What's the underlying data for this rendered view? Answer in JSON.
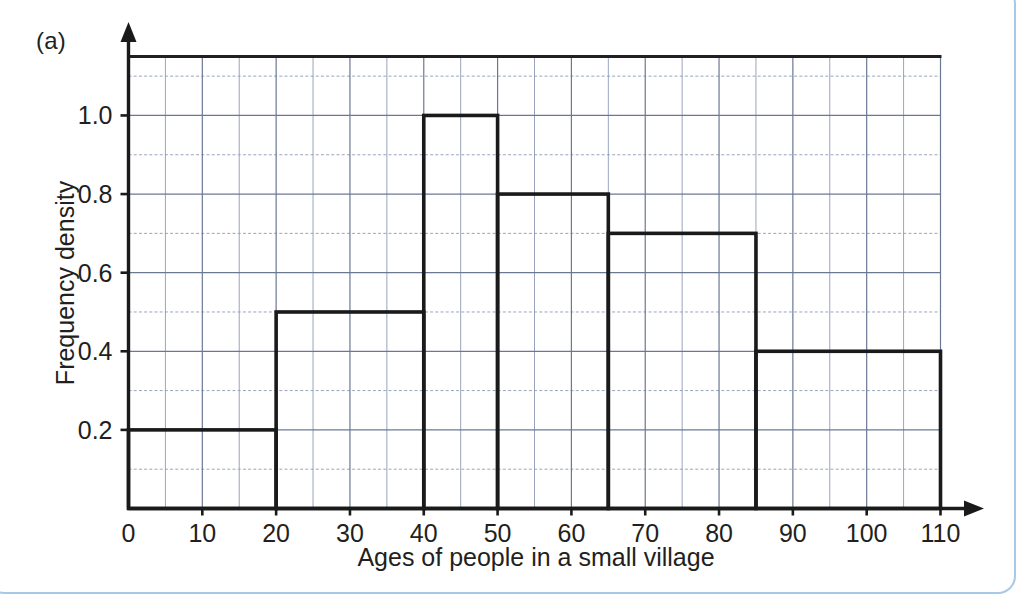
{
  "panel": {
    "label": "(a)"
  },
  "colors": {
    "ink": "#231f20",
    "grid_minor": "#8d9bb5",
    "grid_major": "#6b7894",
    "axis": "#1a1a1a",
    "bar_outline": "#1a1a1a",
    "frame": "#a9c8e6",
    "background": "#ffffff"
  },
  "chart_data": {
    "type": "bar",
    "subtype": "histogram-unequal-widths",
    "title": "",
    "xlabel": "Ages of people in a small village",
    "ylabel": "Frequency density",
    "xlim": [
      0,
      110
    ],
    "ylim": [
      0,
      1.15
    ],
    "grid": true,
    "grid_major_x_step": 10,
    "grid_minor_x_step": 5,
    "grid_major_y_step": 0.2,
    "grid_minor_y_step": 0.1,
    "legend": null,
    "xticks": [
      0,
      10,
      20,
      30,
      40,
      50,
      60,
      70,
      80,
      90,
      100,
      110
    ],
    "xtick_labels": [
      "0",
      "10",
      "20",
      "30",
      "40",
      "50",
      "60",
      "70",
      "80",
      "90",
      "100",
      "110"
    ],
    "yticks": [
      0.2,
      0.4,
      0.6,
      0.8,
      1.0
    ],
    "ytick_labels": [
      "0.2",
      "0.4",
      "0.6",
      "0.8",
      "1.0"
    ],
    "bins": [
      {
        "label": "0-20",
        "x_start": 0,
        "x_end": 20,
        "value": 0.2
      },
      {
        "label": "20-40",
        "x_start": 20,
        "x_end": 40,
        "value": 0.5
      },
      {
        "label": "40-50",
        "x_start": 40,
        "x_end": 50,
        "value": 1.0
      },
      {
        "label": "50-65",
        "x_start": 50,
        "x_end": 65,
        "value": 0.8
      },
      {
        "label": "65-85",
        "x_start": 65,
        "x_end": 85,
        "value": 0.7
      },
      {
        "label": "85-110",
        "x_start": 85,
        "x_end": 110,
        "value": 0.4
      }
    ],
    "categories": [
      "0-20",
      "20-40",
      "40-50",
      "50-65",
      "65-85",
      "85-110"
    ],
    "values": [
      0.2,
      0.5,
      1.0,
      0.8,
      0.7,
      0.4
    ]
  }
}
